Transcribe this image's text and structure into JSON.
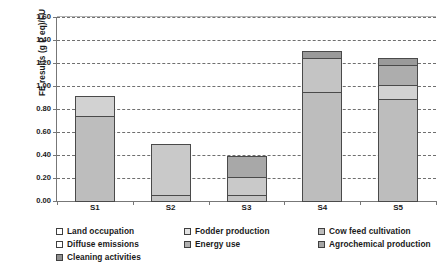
{
  "chart_data": {
    "type": "bar",
    "subtype": "stacked-vertical",
    "title": "",
    "xlabel": "",
    "ylabel": "FE results (g P eq)/FU",
    "ylim": [
      0.0,
      1.6
    ],
    "ytick_step": 0.2,
    "ytick_labels": [
      "0.00",
      "0.20",
      "0.40",
      "0.60",
      "0.80",
      "1.00",
      "1.20",
      "1.40",
      "1.60"
    ],
    "ytick_values": [
      0.0,
      0.2,
      0.4,
      0.6,
      0.8,
      1.0,
      1.2,
      1.4,
      1.6
    ],
    "grid": "horizontal-dashed",
    "legend_position": "bottom",
    "categories": [
      "S1",
      "S2",
      "S3",
      "S4",
      "S5"
    ],
    "series": [
      {
        "name": "Land occupation",
        "color": "#ffffff",
        "values": [
          0.0,
          0.06,
          0.06,
          0.0,
          0.0
        ]
      },
      {
        "name": "Fodder production",
        "color": "#bdbdbd",
        "values": [
          0.75,
          0.0,
          0.0,
          0.96,
          0.9
        ]
      },
      {
        "name": "Cow feed cultivation",
        "color": "#c9c9c9",
        "values": [
          0.0,
          0.45,
          0.17,
          0.0,
          0.13
        ]
      },
      {
        "name": "Diffuse emissions",
        "color": "#d8d8d8",
        "values": [
          0.18,
          0.0,
          0.0,
          0.0,
          0.0
        ]
      },
      {
        "name": "Energy use",
        "color": "#a8a8a8",
        "values": [
          0.0,
          0.0,
          0.19,
          0.3,
          0.18
        ]
      },
      {
        "name": "Agrochemical production",
        "color": "#9a9a9a",
        "values": [
          0.0,
          0.0,
          0.0,
          0.07,
          0.07
        ]
      }
    ],
    "totals": [
      0.93,
      0.51,
      0.42,
      1.33,
      1.28
    ],
    "bars": [
      {
        "category": "S1",
        "total": 0.93,
        "segments": [
          {
            "series": "Fodder production",
            "value": 0.75,
            "color": "#bdbdbd"
          },
          {
            "series": "Diffuse emissions",
            "value": 0.18,
            "color": "#d2d2d2"
          }
        ]
      },
      {
        "category": "S2",
        "total": 0.51,
        "segments": [
          {
            "series": "Land occupation",
            "value": 0.06,
            "color": "#c4c4c4"
          },
          {
            "series": "Cow feed cultivation",
            "value": 0.45,
            "color": "#c9c9c9"
          }
        ]
      },
      {
        "category": "S3",
        "total": 0.42,
        "segments": [
          {
            "series": "Land occupation",
            "value": 0.06,
            "color": "#c4c4c4"
          },
          {
            "series": "Cow feed cultivation",
            "value": 0.17,
            "color": "#c9c9c9"
          },
          {
            "series": "Energy use",
            "value": 0.19,
            "color": "#a8a8a8"
          }
        ]
      },
      {
        "category": "S4",
        "total": 1.33,
        "segments": [
          {
            "series": "Fodder production",
            "value": 0.96,
            "color": "#bdbdbd"
          },
          {
            "series": "Energy use",
            "value": 0.3,
            "color": "#c4c4c4"
          },
          {
            "series": "Agrochemical production",
            "value": 0.07,
            "color": "#9a9a9a"
          }
        ]
      },
      {
        "category": "S5",
        "total": 1.28,
        "segments": [
          {
            "series": "Fodder production",
            "value": 0.9,
            "color": "#bdbdbd"
          },
          {
            "series": "Cow feed cultivation",
            "value": 0.13,
            "color": "#d2d2d2"
          },
          {
            "series": "Energy use",
            "value": 0.18,
            "color": "#adadad"
          },
          {
            "series": "Agrochemical production",
            "value": 0.07,
            "color": "#9a9a9a"
          }
        ]
      }
    ]
  },
  "axis": {
    "y_title": "FE results (g P eq)/FU",
    "y_labels": [
      "1.60",
      "1.40",
      "1.20",
      "1.00",
      "0.80",
      "0.60",
      "0.40",
      "0.20",
      "0.00"
    ],
    "x_labels": [
      "S1",
      "S2",
      "S3",
      "S4",
      "S5"
    ]
  },
  "legend": {
    "items": [
      {
        "label": "Land occupation",
        "color": "#ffffff"
      },
      {
        "label": "Fodder production",
        "color": "#e2e2e2"
      },
      {
        "label": "Cow feed cultivation",
        "color": "#bcbcbc"
      },
      {
        "label": "Diffuse emissions",
        "color": "#ffffff"
      },
      {
        "label": "Energy use",
        "color": "#b0b0b0"
      },
      {
        "label": "Agrochemical production",
        "color": "#a5a5a5"
      },
      {
        "label": "Cleaning activities",
        "color": "#8f8f8f"
      }
    ]
  }
}
